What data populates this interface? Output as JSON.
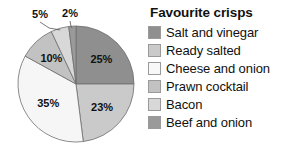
{
  "chart_data": {
    "type": "pie",
    "title": "Favourite crisps",
    "categories": [
      "Salt and vinegar",
      "Ready salted",
      "Cheese and onion",
      "Prawn cocktail",
      "Bacon",
      "Beef and onion"
    ],
    "values": [
      25,
      23,
      35,
      10,
      5,
      2
    ],
    "value_labels": [
      "25%",
      "23%",
      "35%",
      "10%",
      "5%",
      "2%"
    ],
    "unit": "%",
    "start_angle_deg": 0,
    "direction": "clockwise",
    "legend_position": "right",
    "grid": false,
    "xlabel": "",
    "ylabel": "",
    "colors": [
      "#8f8f8f",
      "#cacaca",
      "#f6f6f6",
      "#c2c2c2",
      "#d8d8d8",
      "#9a9a9a"
    ],
    "slices": [
      {
        "label": "Salt and vinegar",
        "value": 25,
        "text": "25%",
        "color": "#8f8f8f",
        "label_placement": "inside"
      },
      {
        "label": "Ready salted",
        "value": 23,
        "text": "23%",
        "color": "#cacaca",
        "label_placement": "inside"
      },
      {
        "label": "Cheese and onion",
        "value": 35,
        "text": "35%",
        "color": "#f6f6f6",
        "label_placement": "inside"
      },
      {
        "label": "Prawn cocktail",
        "value": 10,
        "text": "10%",
        "color": "#c2c2c2",
        "label_placement": "inside"
      },
      {
        "label": "Bacon",
        "value": 5,
        "text": "5%",
        "color": "#d8d8d8",
        "label_placement": "callout"
      },
      {
        "label": "Beef and onion",
        "value": 2,
        "text": "2%",
        "color": "#9a9a9a",
        "label_placement": "callout"
      }
    ]
  },
  "legend": {
    "title": "Favourite crisps",
    "items": [
      {
        "label": "Salt and vinegar",
        "color": "#8f8f8f"
      },
      {
        "label": "Ready salted",
        "color": "#cacaca"
      },
      {
        "label": "Cheese and onion",
        "color": "#f8f8f8"
      },
      {
        "label": "Prawn cocktail",
        "color": "#c2c2c2"
      },
      {
        "label": "Bacon",
        "color": "#d8d8d8"
      },
      {
        "label": "Beef and onion",
        "color": "#9a9a9a"
      }
    ]
  },
  "pie_labels": {
    "inside": [
      "25%",
      "23%",
      "35%",
      "10%"
    ],
    "callout": [
      "5%",
      "2%"
    ]
  }
}
